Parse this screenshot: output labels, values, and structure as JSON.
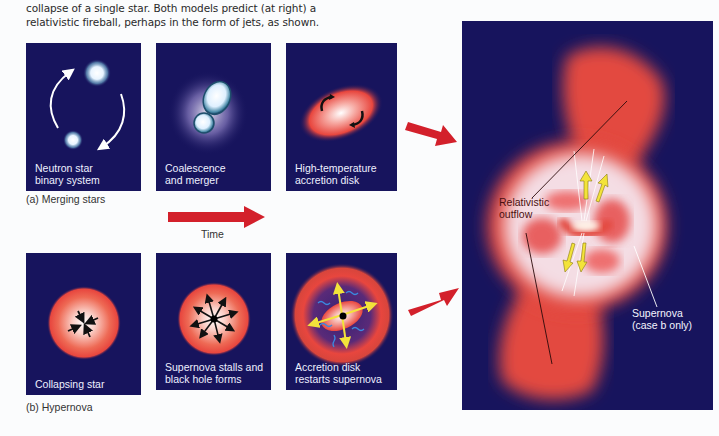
{
  "caption": {
    "line1": "collapse of a single star. Both models predict (at right) a",
    "line2": "relativistic fireball, perhaps in the form of jets, as shown."
  },
  "row_a": {
    "label": "(a) Merging stars",
    "panels": [
      {
        "label": "Neutron star\nbinary system",
        "icon": "orbiting-neutron-stars"
      },
      {
        "label": "Coalescence\nand merger",
        "icon": "merging-stars"
      },
      {
        "label": "High-temperature\naccretion disk",
        "icon": "accretion-disk"
      }
    ]
  },
  "row_b": {
    "label": "(b) Hypernova",
    "panels": [
      {
        "label": "Collapsing star",
        "icon": "collapsing-star"
      },
      {
        "label": "Supernova stalls and\nblack hole forms",
        "icon": "black-hole-formation"
      },
      {
        "label": "Accretion disk\nrestarts supernova",
        "icon": "accretion-disk-supernova"
      }
    ]
  },
  "time_arrow": {
    "label": "Time"
  },
  "main_panel": {
    "annotations": {
      "outflow": "Relativistic\noutflow",
      "supernova": "Supernova\n(case b only)"
    }
  },
  "colors": {
    "panel_bg": "#17145d",
    "arrow_red": "#d3202b",
    "glow_red": "#e8463e",
    "jet_yellow": "#f3e33a"
  }
}
